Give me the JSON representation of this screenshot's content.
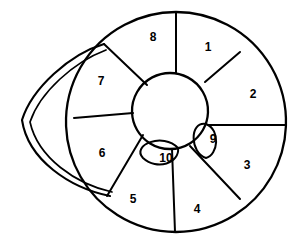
{
  "figure": {
    "type": "line-art-schematic",
    "background_color": "#ffffff",
    "stroke_color": "#000000",
    "label_color": "#000000",
    "outer_ring_segment_count": 8,
    "inner_petal_count": 2,
    "total_segments": 10
  },
  "geometry": {
    "canvas": {
      "width": 301,
      "height": 247
    },
    "outer_circle": {
      "cx": 176,
      "cy": 122,
      "r": 110
    },
    "inner_circle": {
      "cx": 170,
      "cy": 111,
      "r": 38
    },
    "tail_tip": {
      "x": 22,
      "y": 124
    }
  },
  "segments": [
    {
      "id": "1",
      "label": "1",
      "label_x": 208,
      "label_y": 48,
      "ring": "outer"
    },
    {
      "id": "2",
      "label": "2",
      "label_x": 253,
      "label_y": 95,
      "ring": "outer"
    },
    {
      "id": "3",
      "label": "3",
      "label_x": 247,
      "label_y": 166,
      "ring": "outer"
    },
    {
      "id": "4",
      "label": "4",
      "label_x": 197,
      "label_y": 210,
      "ring": "outer"
    },
    {
      "id": "5",
      "label": "5",
      "label_x": 133,
      "label_y": 200,
      "ring": "outer"
    },
    {
      "id": "6",
      "label": "6",
      "label_x": 102,
      "label_y": 154,
      "ring": "outer"
    },
    {
      "id": "7",
      "label": "7",
      "label_x": 101,
      "label_y": 82,
      "ring": "outer"
    },
    {
      "id": "8",
      "label": "8",
      "label_x": 153,
      "label_y": 38,
      "ring": "outer"
    },
    {
      "id": "9",
      "label": "9",
      "label_x": 213,
      "label_y": 140,
      "ring": "inner-petal"
    },
    {
      "id": "10",
      "label": "10",
      "label_x": 166,
      "label_y": 159,
      "ring": "inner-petal"
    }
  ],
  "paths": {
    "outer_circle": "M 176 12 A 110 110 0 1 1 175.99 12 Z",
    "inner_circle": "M 170 73 A 38 38 0 1 1 169.99 73 Z",
    "spoke_1_2": "M 205 82 L 240 52",
    "spoke_2_3": "M 208 125 L 286 125",
    "spoke_3_4": "M 190 146 L 240 199",
    "spoke_4_5": "M 172 149 L 175 232",
    "spoke_5_6": "M 143 135 L 107 196",
    "spoke_6_7": "M 133 113 L 74 118",
    "spoke_7_8": "M 147 85 L 104 44",
    "spoke_8_1": "M 176 73 L 176 12",
    "petal_9": "M 206 124 C 189 121 190 153 206 158 C 218 155 221 130 206 124 Z",
    "petal_10": "M 178 148 C 163 132 131 145 143 158 C 157 171 180 163 178 148 Z",
    "tail_outer": "M 104 44 C 70 54 32 88 22 120 C 28 160 70 188 110 196",
    "tail_inner": "M 106 50 C 74 62 40 92 30 122 C 38 158 76 184 112 192"
  },
  "tail": {
    "name": "lateral tapered extension",
    "description": "double-contour crescent projecting to the left from the circle",
    "attaches_upper": {
      "x": 104,
      "y": 44
    },
    "attaches_lower": {
      "x": 110,
      "y": 196
    }
  }
}
